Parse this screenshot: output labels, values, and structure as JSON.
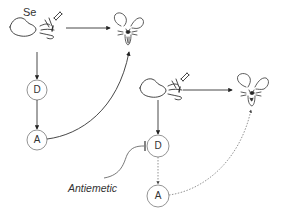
{
  "diagram": {
    "top_panel": {
      "stimulus_label": "Se",
      "nodes": [
        {
          "id": "D",
          "label": "D"
        },
        {
          "id": "A",
          "label": "A"
        }
      ]
    },
    "bottom_panel": {
      "nodes": [
        {
          "id": "D",
          "label": "D"
        },
        {
          "id": "A",
          "label": "A"
        }
      ],
      "inhibitor_label": "Antiemetic"
    },
    "colors": {
      "line": "#333333",
      "node_stroke": "#888888",
      "dotted": "#777777"
    }
  }
}
